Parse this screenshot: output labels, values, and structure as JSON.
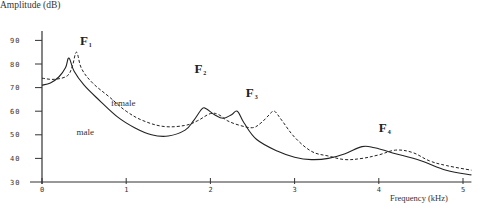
{
  "chart_data": {
    "type": "line",
    "title": "",
    "xlabel": "Frequency (kHz)",
    "ylabel": "Amplitude (dB)",
    "xlim": [
      0,
      5.1
    ],
    "ylim": [
      30,
      92
    ],
    "xticks": [
      0,
      1,
      2,
      3,
      4,
      5
    ],
    "yticks": [
      30,
      40,
      50,
      60,
      70,
      80,
      90
    ],
    "grid": false,
    "legend": "inline labels",
    "series": [
      {
        "name": "male",
        "style": "solid",
        "x": [
          0,
          0.1,
          0.2,
          0.28,
          0.32,
          0.38,
          0.5,
          0.7,
          0.9,
          1.1,
          1.3,
          1.5,
          1.7,
          1.8,
          1.9,
          1.95,
          2.05,
          2.15,
          2.25,
          2.32,
          2.4,
          2.55,
          2.8,
          3.0,
          3.2,
          3.4,
          3.6,
          3.8,
          3.95,
          4.2,
          4.5,
          4.8,
          5.1
        ],
        "y": [
          71,
          72,
          74.5,
          78.5,
          82.5,
          77,
          71,
          64,
          57.5,
          53,
          50,
          49.5,
          52,
          56,
          61,
          61,
          58.5,
          57,
          58.5,
          60,
          55,
          48,
          43,
          40.5,
          39.5,
          40,
          42,
          45,
          44.5,
          42,
          39,
          35,
          33
        ]
      },
      {
        "name": "female",
        "style": "dashed",
        "x": [
          0,
          0.15,
          0.3,
          0.36,
          0.41,
          0.47,
          0.6,
          0.8,
          1.0,
          1.2,
          1.45,
          1.7,
          1.85,
          2.0,
          2.1,
          2.2,
          2.35,
          2.5,
          2.6,
          2.7,
          2.76,
          2.85,
          3.0,
          3.2,
          3.4,
          3.6,
          3.8,
          4.0,
          4.2,
          4.4,
          4.6,
          4.8,
          5.1
        ],
        "y": [
          74,
          73.5,
          75,
          79,
          85,
          78,
          72,
          66,
          60,
          56,
          53.5,
          54,
          56,
          59,
          58.5,
          56,
          54,
          53,
          55,
          58.5,
          60,
          56,
          49,
          43,
          41,
          39.5,
          40,
          41.5,
          43.5,
          42.5,
          39,
          37,
          35
        ]
      }
    ],
    "annotations": [
      {
        "text": "F",
        "sub": "1",
        "x": 0.45,
        "y": 88
      },
      {
        "text": "F",
        "sub": "2",
        "x": 1.81,
        "y": 76
      },
      {
        "text": "F",
        "sub": "3",
        "x": 2.42,
        "y": 66
      },
      {
        "text": "F",
        "sub": "4",
        "x": 4.0,
        "y": 51
      },
      {
        "text": "female",
        "x": 0.82,
        "y": 62
      },
      {
        "text": "male",
        "x": 0.41,
        "y": 50
      }
    ]
  },
  "axes": {
    "ylabel": "Amplitude (dB)",
    "xlabel": "Frequency (kHz)"
  }
}
